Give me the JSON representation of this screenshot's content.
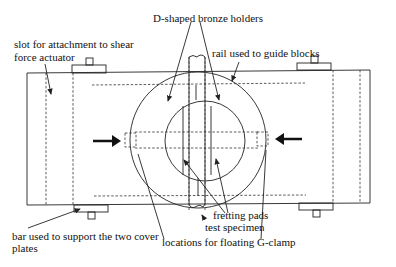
{
  "diagram": {
    "labels": {
      "d_shaped": "D-shaped bronze holders",
      "slot_line1": "slot for attachment to shear",
      "slot_line2": "force actuator",
      "rail": "rail used to guide blocks",
      "bar_line1": "bar used to support the two cover",
      "bar_line2": "plates",
      "fretting": "fretting pads",
      "specimen": "test specimen",
      "gclamp": "locations for floating G-clamp"
    },
    "colors": {
      "line": "#222222",
      "background": "#ffffff"
    }
  }
}
